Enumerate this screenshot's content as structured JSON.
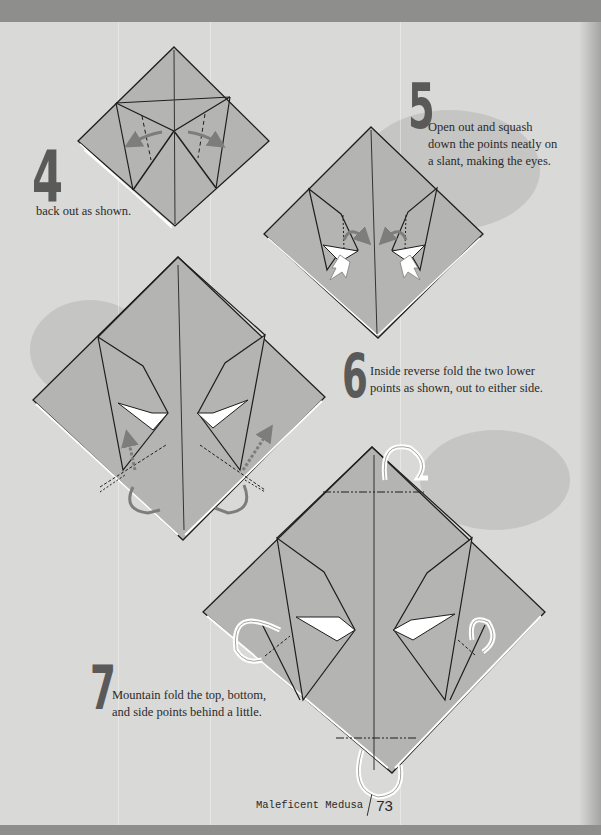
{
  "page": {
    "number": "73",
    "running_title": "Maleficent Medusa",
    "colors": {
      "background": "#d9d9d7",
      "band": "#8e8e8c",
      "paper_fill": "#b4b4b2",
      "line": "#1e1e1e",
      "arrow_gray": "#7d7d7b",
      "number_color": "#5a5a5a"
    }
  },
  "steps": [
    {
      "number": "4",
      "text": "back out as shown."
    },
    {
      "number": "5",
      "text_lines": [
        "Open out and squash",
        "down the points neatly on",
        "a slant, making the eyes."
      ]
    },
    {
      "number": "6",
      "text_lines": [
        "Inside reverse fold the two lower",
        "points as shown, out to either side."
      ]
    },
    {
      "number": "7",
      "text_lines": [
        "Mountain fold the top, bottom,",
        "and side points behind a little."
      ]
    }
  ],
  "diagrams": [
    {
      "step": "4",
      "icons": [
        "valley-fold-arrow-left",
        "valley-fold-arrow-right"
      ]
    },
    {
      "step": "5",
      "icons": [
        "squash-arrow-left",
        "squash-arrow-right",
        "push-arrow-left",
        "push-arrow-right"
      ]
    },
    {
      "step": "6",
      "icons": [
        "inside-reverse-arrow-left",
        "inside-reverse-arrow-right"
      ]
    },
    {
      "step": "7",
      "icons": [
        "mountain-fold-arrow-top",
        "mountain-fold-arrow-bottom",
        "mountain-fold-arrow-left",
        "mountain-fold-arrow-right"
      ]
    }
  ]
}
